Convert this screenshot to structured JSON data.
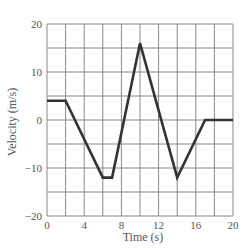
{
  "chart_data": {
    "type": "line",
    "title": "",
    "xlabel": "Time (s)",
    "ylabel": "Velocity (m/s)",
    "xlim": [
      0,
      20
    ],
    "ylim": [
      -20,
      20
    ],
    "x_ticks": [
      0,
      4,
      8,
      12,
      16,
      20
    ],
    "y_ticks": [
      20,
      10,
      0,
      -10,
      -20
    ],
    "x_tick_labels": [
      "0",
      "4",
      "8",
      "12",
      "16",
      "20"
    ],
    "y_tick_labels": [
      "20",
      "10",
      "0",
      "−10",
      "−20"
    ],
    "grid": true,
    "grid_x_step": 2,
    "grid_y_step": 5,
    "legend": null,
    "series": [
      {
        "name": "velocity",
        "color": "#333333",
        "x": [
          0,
          2,
          6,
          7,
          10,
          14,
          17,
          20
        ],
        "y": [
          4,
          4,
          -12,
          -12,
          16,
          -12,
          0,
          0
        ]
      }
    ]
  },
  "colors": {
    "grid": "#888888",
    "line": "#333333",
    "text": "#555555"
  }
}
